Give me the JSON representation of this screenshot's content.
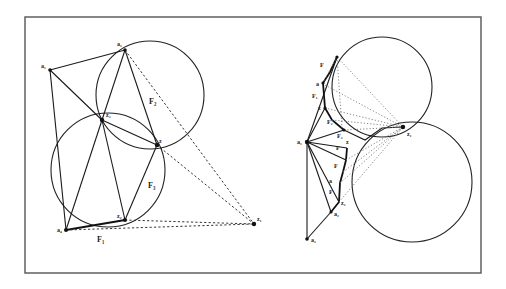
{
  "figure": {
    "frame": {
      "x": 25,
      "y": 17,
      "width": 456,
      "height": 256
    },
    "left": {
      "circles": [
        {
          "name": "upper-circle",
          "cx": 150,
          "cy": 95,
          "r": 54
        },
        {
          "name": "lower-circle",
          "cx": 108,
          "cy": 170,
          "r": 57
        }
      ],
      "points": {
        "a1": {
          "x": 50,
          "y": 70,
          "label": "a₁"
        },
        "a2": {
          "x": 125,
          "y": 50,
          "label": "a₂"
        },
        "z3": {
          "x": 102,
          "y": 120,
          "label": "z₃"
        },
        "z": {
          "x": 157,
          "y": 145,
          "label": "z"
        },
        "z2": {
          "x": 125,
          "y": 220,
          "label": "z₂"
        },
        "a4": {
          "x": 66,
          "y": 230,
          "label": "a₄"
        },
        "z1": {
          "x": 254,
          "y": 224,
          "label": "z₁"
        }
      },
      "region_labels": [
        {
          "text": "F₂",
          "x": 149,
          "y": 104
        },
        {
          "text": "F₃",
          "x": 148,
          "y": 188
        },
        {
          "text": "F₁",
          "x": 97,
          "y": 242
        }
      ]
    },
    "right": {
      "circles": [
        {
          "name": "upper-circle",
          "cx": 382,
          "cy": 87,
          "r": 50
        },
        {
          "name": "lower-circle",
          "cx": 412,
          "cy": 182,
          "r": 60
        }
      ],
      "labels": [
        {
          "text": "F",
          "x": 320,
          "y": 67
        },
        {
          "text": "a",
          "x": 318,
          "y": 86
        },
        {
          "text": "F₁",
          "x": 312,
          "y": 98
        },
        {
          "text": "z",
          "x": 320,
          "y": 108
        },
        {
          "text": "F₂",
          "x": 327,
          "y": 124
        },
        {
          "text": "a₁",
          "x": 298,
          "y": 142
        },
        {
          "text": "F₃",
          "x": 337,
          "y": 138
        },
        {
          "text": "z",
          "x": 346,
          "y": 144
        },
        {
          "text": "F",
          "x": 336,
          "y": 148
        },
        {
          "text": "F",
          "x": 334,
          "y": 167
        },
        {
          "text": "a",
          "x": 329,
          "y": 182
        },
        {
          "text": "F",
          "x": 329,
          "y": 193
        },
        {
          "text": "z₂",
          "x": 340,
          "y": 205
        },
        {
          "text": "a₂",
          "x": 334,
          "y": 215
        },
        {
          "text": "a₃",
          "x": 311,
          "y": 240
        },
        {
          "text": "z₁",
          "x": 405,
          "y": 135
        }
      ]
    }
  }
}
